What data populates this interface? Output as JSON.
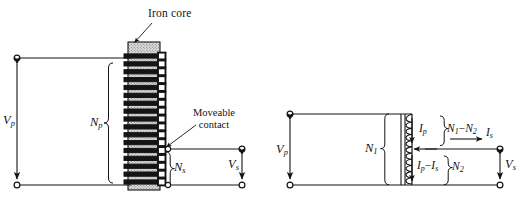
{
  "figure": {
    "title_hidden": "",
    "background": "#ffffff",
    "ink": "#141414",
    "core_fill": "#d9d9d9",
    "panels": [
      {
        "name": "physical-autotransformer",
        "annotations": {
          "iron_core": "Iron core",
          "moveable_contact_line1": "Moveable",
          "moveable_contact_line2": "contact"
        },
        "labels": {
          "primary_voltage": "V",
          "primary_voltage_sub": "p",
          "secondary_voltage": "V",
          "secondary_voltage_sub": "s",
          "primary_turns": "N",
          "primary_turns_sub": "p",
          "secondary_turns": "N",
          "secondary_turns_sub": "s"
        },
        "winding_turns": 17
      },
      {
        "name": "schematic-autotransformer",
        "labels": {
          "primary_voltage": "V",
          "primary_voltage_sub": "p",
          "secondary_voltage": "V",
          "secondary_voltage_sub": "s",
          "turns_upper": "N",
          "turns_upper_sub": "1",
          "turns_lower": "N",
          "turns_lower_sub": "2",
          "turns_series": "N",
          "turns_series_sub1": "1",
          "turns_series_op": "−",
          "turns_series_sub2": "2",
          "current_primary": "I",
          "current_primary_sub": "p",
          "current_secondary": "I",
          "current_secondary_sub": "s",
          "current_common": "I",
          "current_common_sub1": "p",
          "current_common_op": "−",
          "current_common_sub2": "s"
        }
      }
    ]
  }
}
